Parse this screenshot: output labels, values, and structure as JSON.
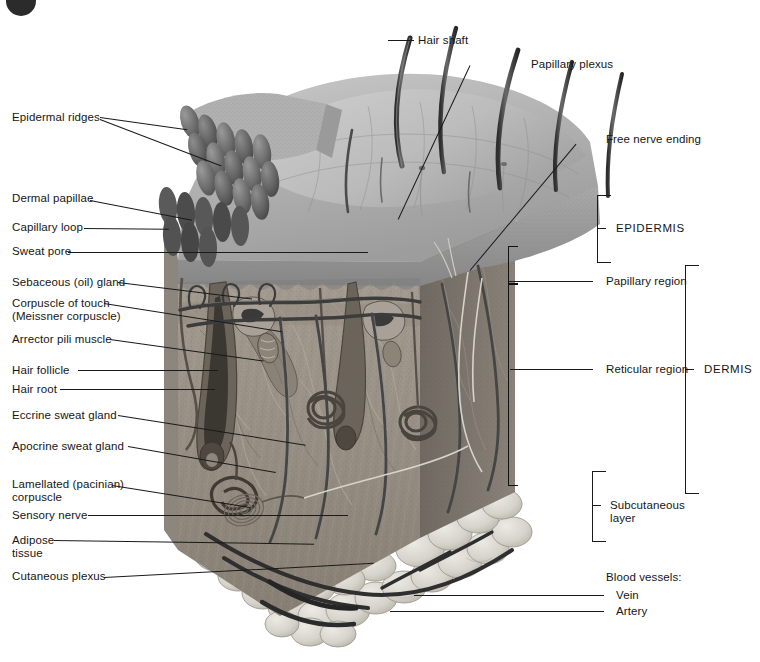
{
  "figure": {
    "type": "anatomical-illustration",
    "style": "grayscale pencil rendering, sectioned block of skin"
  },
  "labels_left": [
    {
      "id": "epidermal-ridges",
      "text": "Epidermal ridges"
    },
    {
      "id": "dermal-papillae",
      "text": "Dermal papillae"
    },
    {
      "id": "capillary-loop",
      "text": "Capillary loop"
    },
    {
      "id": "sweat-pore",
      "text": "Sweat pore"
    },
    {
      "id": "sebaceous-gland",
      "text": "Sebaceous (oil) gland"
    },
    {
      "id": "corpuscle-of-touch",
      "text": "Corpuscle of touch"
    },
    {
      "id": "meissner-corpuscle",
      "text": "(Meissner corpuscle)"
    },
    {
      "id": "arrector-pili",
      "text": "Arrector pili muscle"
    },
    {
      "id": "hair-follicle",
      "text": "Hair follicle"
    },
    {
      "id": "hair-root",
      "text": "Hair root"
    },
    {
      "id": "eccrine-gland",
      "text": "Eccrine sweat gland"
    },
    {
      "id": "apocrine-gland",
      "text": "Apocrine sweat gland"
    },
    {
      "id": "lamellated-1",
      "text": "Lamellated (pacinian)"
    },
    {
      "id": "lamellated-2",
      "text": "corpuscle"
    },
    {
      "id": "sensory-nerve",
      "text": "Sensory nerve"
    },
    {
      "id": "adipose-1",
      "text": "Adipose"
    },
    {
      "id": "adipose-2",
      "text": "tissue"
    },
    {
      "id": "cutaneous-plexus",
      "text": "Cutaneous plexus"
    }
  ],
  "labels_right": [
    {
      "id": "hair-shaft",
      "text": "Hair shaft"
    },
    {
      "id": "papillary-plexus",
      "text": "Papillary plexus"
    },
    {
      "id": "free-nerve-ending",
      "text": "Free nerve ending"
    },
    {
      "id": "epidermis",
      "text": "EPIDERMIS"
    },
    {
      "id": "papillary-region",
      "text": "Papillary region"
    },
    {
      "id": "reticular-region",
      "text": "Reticular region"
    },
    {
      "id": "dermis",
      "text": "DERMIS"
    },
    {
      "id": "subcutaneous-1",
      "text": "Subcutaneous"
    },
    {
      "id": "subcutaneous-2",
      "text": "layer"
    },
    {
      "id": "blood-vessels",
      "text": "Blood vessels:"
    },
    {
      "id": "vein",
      "text": "Vein"
    },
    {
      "id": "artery",
      "text": "Artery"
    }
  ],
  "colors": {
    "background": "#ffffff",
    "text": "#161616",
    "leader_line": "#1a1a1a",
    "epidermis_surface": "#b9b9b9",
    "epidermis_cut": "#8f8f8f",
    "dermis_face": "#9a9389",
    "dermis_side": "#7d766d",
    "subcutaneous_fat": "#d8d5cd",
    "hair": "#3a3a3a",
    "vessel_dark": "#343434",
    "badge": "#2b2b2b"
  }
}
